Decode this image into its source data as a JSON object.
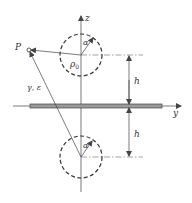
{
  "diagram": {
    "colors": {
      "line": "#444444",
      "plate_fill": "#9a9a9a",
      "background": "#ffffff"
    },
    "labels": {
      "z_axis": "z",
      "y_axis": "y",
      "point": "P",
      "upper_alpha": "α",
      "lower_alpha": "α",
      "rho": "ρ",
      "rho_sub": "0",
      "medium": "γ, ε",
      "h_upper": "h",
      "h_lower": "h"
    }
  }
}
